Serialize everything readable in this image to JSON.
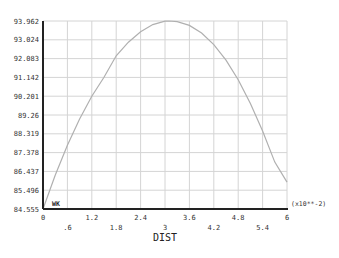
{
  "chart_data": {
    "type": "line",
    "title": "",
    "xlabel": "DIST",
    "ylabel": "",
    "x_multiplier": "(x10**-2)",
    "xlim": [
      0,
      6
    ],
    "ylim": [
      84.555,
      93.962
    ],
    "grid": true,
    "x_ticks_upper": [
      "0",
      "1.2",
      "2.4",
      "3.6",
      "4.8",
      "6"
    ],
    "x_ticks_lower": [
      ".6",
      "1.8",
      "3",
      "4.2",
      "5.4"
    ],
    "y_ticks": [
      "93.962",
      "93.024",
      "92.083",
      "91.142",
      "90.201",
      "89.26",
      "88.319",
      "87.378",
      "86.437",
      "85.496",
      "84.555"
    ],
    "legend": [
      "WK"
    ],
    "series": [
      {
        "name": "WK",
        "color": "#b0b0b0",
        "x": [
          0,
          0.3,
          0.6,
          0.9,
          1.2,
          1.5,
          1.8,
          2.1,
          2.4,
          2.7,
          3.0,
          3.1,
          3.3,
          3.6,
          3.9,
          4.2,
          4.5,
          4.8,
          5.1,
          5.4,
          5.7,
          6.0
        ],
        "y": [
          84.555,
          86.24,
          87.74,
          89.06,
          90.2,
          91.15,
          92.22,
          92.9,
          93.42,
          93.78,
          93.95,
          93.96,
          93.93,
          93.74,
          93.36,
          92.78,
          92.0,
          91.02,
          89.84,
          88.46,
          86.9,
          85.9
        ]
      }
    ]
  }
}
